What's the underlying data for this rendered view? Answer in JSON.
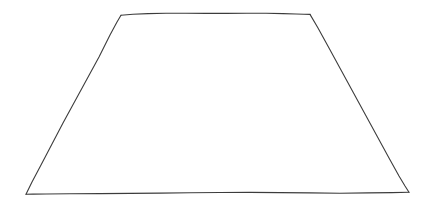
{
  "canvas": {
    "width": 431,
    "height": 207,
    "background_color": "#ffffff",
    "title": "Hand-drawn trapezoid sketch"
  },
  "drawing": {
    "name": "trapezoid",
    "description": "Hand-drawn quadrilateral: wide base, narrower top, slanted left and right sides",
    "stroke_color": "#3c3c3c",
    "stroke_width": 1.1,
    "fill_color": "none",
    "style": "hand-drawn",
    "vertices": [
      {
        "label": "top-left",
        "x": 121,
        "y": 15
      },
      {
        "label": "top-right",
        "x": 310,
        "y": 14
      },
      {
        "label": "bottom-right",
        "x": 409,
        "y": 192
      },
      {
        "label": "bottom-left",
        "x": 26,
        "y": 194
      }
    ],
    "edges": [
      {
        "name": "top-edge",
        "from": "top-left",
        "to": "top-right",
        "path": "M 121 15.3 L 133 14.2 L 148 13.6 L 166 13.2 L 186 13.3 L 206 13.4 L 226 13.4 L 247 13.3 L 266 13.2 L 283 13.6 L 296 14.0 L 304 14.2 L 310 14.4"
      },
      {
        "name": "right-edge",
        "from": "top-right",
        "to": "bottom-right",
        "path": "M 310 14.4 L 318 28 L 329 48 L 341 70 L 353 92 L 365 114 L 377 136 L 389 158 L 399 176 L 405 186 L 409 192.2"
      },
      {
        "name": "bottom-edge",
        "from": "bottom-right",
        "to": "bottom-left",
        "path": "M 409 192.2 L 392 192.6 L 368 192.9 L 340 193.2 L 310 192.9 L 280 192.6 L 250 192.4 L 220 192.5 L 190 192.8 L 160 193.1 L 130 193.4 L 100 193.6 L 70 193.8 L 46 194.0 L 33 194.1 L 26 194.2"
      },
      {
        "name": "left-edge",
        "from": "bottom-left",
        "to": "top-left",
        "path": "M 26 194.2 L 32 182 L 41 165 L 52 144 L 63 123 L 75 101 L 87 79 L 99 57 L 110 35 L 117 22 L 121 15.3"
      }
    ]
  }
}
